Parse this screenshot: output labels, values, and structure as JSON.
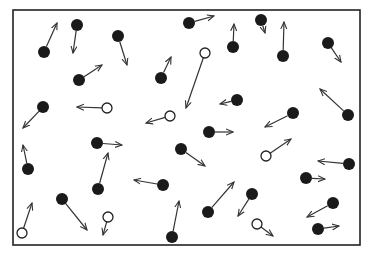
{
  "diagram": {
    "type": "gas-molecules-in-container",
    "colors": {
      "border": "#222222",
      "filled": "#1a1a1a",
      "open_fill": "#ffffff",
      "arrow": "#333333",
      "background": "#ffffff"
    },
    "container": {
      "x": 13,
      "y": 10,
      "width": 347,
      "height": 235
    },
    "legend": [
      {
        "kind": "filled",
        "meaning": "dark molecule"
      },
      {
        "kind": "open",
        "meaning": "light molecule"
      }
    ],
    "particles": [
      {
        "kind": "filled",
        "x": 44,
        "y": 52,
        "vx": 57,
        "vy": 23
      },
      {
        "kind": "filled",
        "x": 77,
        "y": 25,
        "vx": 73,
        "vy": 53
      },
      {
        "kind": "filled",
        "x": 118,
        "y": 36,
        "vx": 127,
        "vy": 65
      },
      {
        "kind": "filled",
        "x": 79,
        "y": 80,
        "vx": 102,
        "vy": 65
      },
      {
        "kind": "filled",
        "x": 189,
        "y": 23,
        "vx": 214,
        "vy": 16
      },
      {
        "kind": "filled",
        "x": 233,
        "y": 47,
        "vx": 234,
        "vy": 24
      },
      {
        "kind": "filled",
        "x": 161,
        "y": 78,
        "vx": 171,
        "vy": 57
      },
      {
        "kind": "open",
        "x": 205,
        "y": 53,
        "vx": 186,
        "vy": 108
      },
      {
        "kind": "filled",
        "x": 261,
        "y": 20,
        "vx": 265,
        "vy": 33
      },
      {
        "kind": "filled",
        "x": 283,
        "y": 56,
        "vx": 284,
        "vy": 22
      },
      {
        "kind": "filled",
        "x": 328,
        "y": 43,
        "vx": 341,
        "vy": 62
      },
      {
        "kind": "filled",
        "x": 43,
        "y": 107,
        "vx": 23,
        "vy": 128
      },
      {
        "kind": "open",
        "x": 107,
        "y": 108,
        "vx": 77,
        "vy": 107
      },
      {
        "kind": "filled",
        "x": 97,
        "y": 143,
        "vx": 122,
        "vy": 145
      },
      {
        "kind": "filled",
        "x": 28,
        "y": 169,
        "vx": 23,
        "vy": 145
      },
      {
        "kind": "filled",
        "x": 237,
        "y": 100,
        "vx": 220,
        "vy": 104
      },
      {
        "kind": "open",
        "x": 170,
        "y": 116,
        "vx": 146,
        "vy": 123
      },
      {
        "kind": "filled",
        "x": 209,
        "y": 132,
        "vx": 233,
        "vy": 132
      },
      {
        "kind": "filled",
        "x": 181,
        "y": 149,
        "vx": 205,
        "vy": 166
      },
      {
        "kind": "filled",
        "x": 293,
        "y": 113,
        "vx": 265,
        "vy": 127
      },
      {
        "kind": "filled",
        "x": 348,
        "y": 115,
        "vx": 320,
        "vy": 89
      },
      {
        "kind": "open",
        "x": 266,
        "y": 156,
        "vx": 291,
        "vy": 139
      },
      {
        "kind": "filled",
        "x": 349,
        "y": 164,
        "vx": 318,
        "vy": 161
      },
      {
        "kind": "open",
        "x": 22,
        "y": 233,
        "vx": 32,
        "vy": 203
      },
      {
        "kind": "filled",
        "x": 62,
        "y": 199,
        "vx": 87,
        "vy": 230
      },
      {
        "kind": "filled",
        "x": 98,
        "y": 189,
        "vx": 108,
        "vy": 153
      },
      {
        "kind": "open",
        "x": 108,
        "y": 217,
        "vx": 103,
        "vy": 235
      },
      {
        "kind": "filled",
        "x": 163,
        "y": 185,
        "vx": 134,
        "vy": 180
      },
      {
        "kind": "filled",
        "x": 172,
        "y": 237,
        "vx": 179,
        "vy": 201
      },
      {
        "kind": "filled",
        "x": 208,
        "y": 212,
        "vx": 234,
        "vy": 182
      },
      {
        "kind": "filled",
        "x": 306,
        "y": 178,
        "vx": 325,
        "vy": 179
      },
      {
        "kind": "filled",
        "x": 252,
        "y": 194,
        "vx": 238,
        "vy": 216
      },
      {
        "kind": "filled",
        "x": 333,
        "y": 203,
        "vx": 307,
        "vy": 217
      },
      {
        "kind": "open",
        "x": 257,
        "y": 224,
        "vx": 273,
        "vy": 236
      },
      {
        "kind": "filled",
        "x": 318,
        "y": 229,
        "vx": 339,
        "vy": 226
      }
    ]
  }
}
